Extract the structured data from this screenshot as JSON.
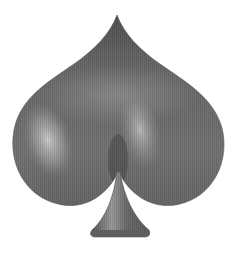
{
  "image": {
    "subject": "spade-suit-symbol",
    "background_color": "#ffffff",
    "colors": {
      "base": "#6e6e6e",
      "dark_edge": "#3f3f3f",
      "highlight": "#c9c9c9",
      "mid": "#8a8a8a"
    }
  }
}
